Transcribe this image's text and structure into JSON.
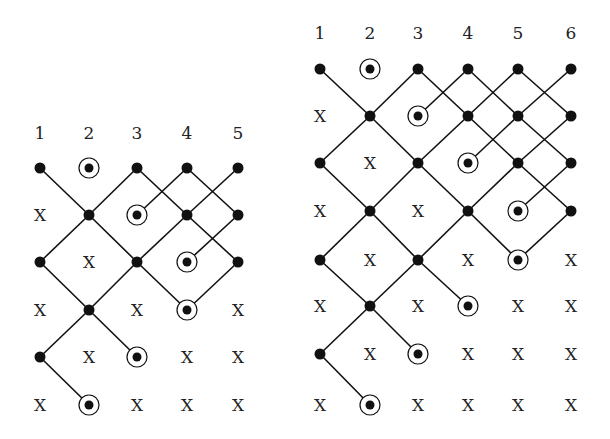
{
  "diagrams": [
    {
      "name": "left-lattice",
      "columns": [
        "1",
        "2",
        "3",
        "4",
        "5"
      ],
      "col_x": [
        40,
        89,
        137,
        187,
        238
      ],
      "label_y": 133,
      "row_y": [
        168,
        215,
        262,
        310,
        357,
        405
      ],
      "grid": [
        [
          "dot",
          "circ",
          "dot",
          "dot",
          "dot"
        ],
        [
          "X",
          "dot",
          "circ",
          "dot",
          "dot"
        ],
        [
          "dot",
          "X",
          "dot",
          "circ",
          "dot"
        ],
        [
          "X",
          "dot",
          "X",
          "circ",
          "X"
        ],
        [
          "dot",
          "X",
          "circ",
          "X",
          "X"
        ],
        [
          "X",
          "circ",
          "X",
          "X",
          "X"
        ]
      ],
      "edges": [
        [
          1,
          1,
          2,
          2
        ],
        [
          3,
          1,
          2,
          2
        ],
        [
          2,
          2,
          1,
          3
        ],
        [
          2,
          2,
          3,
          3
        ],
        [
          3,
          1,
          4,
          2
        ],
        [
          4,
          1,
          3,
          2
        ],
        [
          4,
          1,
          5,
          2
        ],
        [
          5,
          1,
          4,
          2
        ],
        [
          4,
          2,
          3,
          3
        ],
        [
          4,
          2,
          5,
          3
        ],
        [
          5,
          2,
          4,
          3
        ],
        [
          1,
          3,
          2,
          4
        ],
        [
          3,
          3,
          2,
          4
        ],
        [
          3,
          3,
          4,
          4
        ],
        [
          5,
          3,
          4,
          4
        ],
        [
          2,
          4,
          1,
          5
        ],
        [
          2,
          4,
          3,
          5
        ],
        [
          1,
          5,
          2,
          6
        ]
      ]
    },
    {
      "name": "right-lattice",
      "columns": [
        "1",
        "2",
        "3",
        "4",
        "5",
        "6"
      ],
      "col_x": [
        320,
        370,
        418,
        468,
        518,
        571
      ],
      "label_y": 33,
      "row_y": [
        69,
        116,
        163,
        211,
        260,
        306,
        354,
        405
      ],
      "grid": [
        [
          "dot",
          "circ",
          "dot",
          "dot",
          "dot",
          "dot"
        ],
        [
          "X",
          "dot",
          "circ",
          "dot",
          "dot",
          "dot"
        ],
        [
          "dot",
          "X",
          "dot",
          "circ",
          "dot",
          "dot"
        ],
        [
          "X",
          "dot",
          "X",
          "dot",
          "circ",
          "dot"
        ],
        [
          "dot",
          "X",
          "dot",
          "X",
          "circ",
          "X"
        ],
        [
          "X",
          "dot",
          "X",
          "circ",
          "X",
          "X"
        ],
        [
          "dot",
          "X",
          "circ",
          "X",
          "X",
          "X"
        ],
        [
          "X",
          "circ",
          "X",
          "X",
          "X",
          "X"
        ]
      ],
      "edges": [
        [
          1,
          1,
          2,
          2
        ],
        [
          3,
          1,
          2,
          2
        ],
        [
          2,
          2,
          1,
          3
        ],
        [
          2,
          2,
          3,
          3
        ],
        [
          3,
          1,
          4,
          2
        ],
        [
          4,
          1,
          3,
          2
        ],
        [
          4,
          1,
          5,
          2
        ],
        [
          5,
          1,
          4,
          2
        ],
        [
          5,
          1,
          6,
          2
        ],
        [
          6,
          1,
          5,
          2
        ],
        [
          4,
          2,
          3,
          3
        ],
        [
          4,
          2,
          5,
          3
        ],
        [
          5,
          2,
          4,
          3
        ],
        [
          5,
          2,
          6,
          3
        ],
        [
          6,
          2,
          5,
          3
        ],
        [
          3,
          3,
          2,
          4
        ],
        [
          3,
          3,
          4,
          4
        ],
        [
          5,
          3,
          4,
          4
        ],
        [
          5,
          3,
          6,
          4
        ],
        [
          6,
          3,
          5,
          4
        ],
        [
          1,
          3,
          2,
          4
        ],
        [
          2,
          4,
          1,
          5
        ],
        [
          2,
          4,
          3,
          5
        ],
        [
          4,
          4,
          3,
          5
        ],
        [
          4,
          4,
          5,
          5
        ],
        [
          6,
          4,
          5,
          5
        ],
        [
          3,
          5,
          2,
          6
        ],
        [
          3,
          5,
          4,
          6
        ],
        [
          1,
          5,
          2,
          6
        ],
        [
          2,
          6,
          1,
          7
        ],
        [
          2,
          6,
          3,
          7
        ],
        [
          1,
          7,
          2,
          8
        ]
      ]
    }
  ],
  "symbols": {
    "X": "X"
  },
  "colors": {
    "ink": "#111111",
    "background": "#ffffff"
  }
}
